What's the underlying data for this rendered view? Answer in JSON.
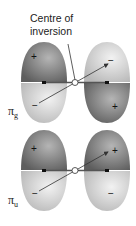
{
  "title_line1": "Centre of",
  "title_line2": "inversion",
  "labels": {
    "pi_g": "π",
    "pi_g_sub": "g",
    "pi_u": "π",
    "pi_u_sub": "u"
  },
  "colors": {
    "dark_lobe": "#7a7a7a",
    "light_lobe": "#d4d4d4",
    "axis": "#555555"
  },
  "pi_g": {
    "upper_left": "+",
    "upper_right": "−",
    "lower_left": "−",
    "lower_right": "+"
  },
  "pi_u": {
    "upper_left": "+",
    "upper_right": "+",
    "lower_left": "−",
    "lower_right": "−"
  }
}
